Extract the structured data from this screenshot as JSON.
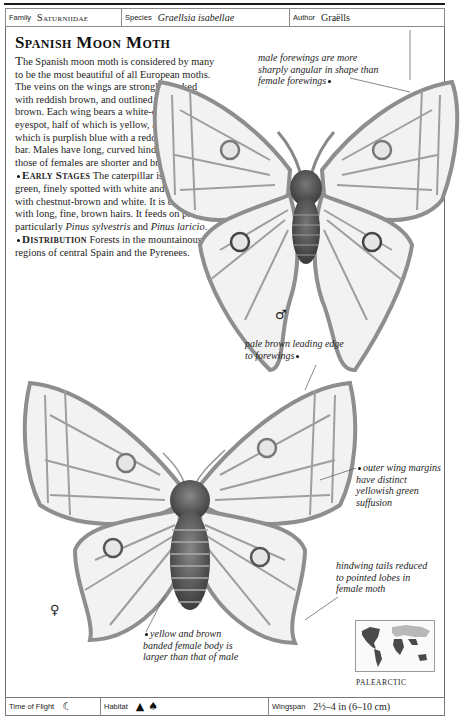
{
  "header": {
    "family_label": "Family",
    "family_value": "Saturniidae",
    "species_label": "Species",
    "species_value": "Graellsia isabellae",
    "author_label": "Author",
    "author_value": "Graëlls"
  },
  "title": "Spanish Moon Moth",
  "body": {
    "intro_first": "T",
    "intro_rest": "he Spanish moon moth is considered by many to be the most beautiful of all European moths. The veins on the wings are strongly marked with reddish brown, and outlined with dark brown. Each wing bears a white-centered eyespot, half of which is yellow, and half of which is purplish blue with a reddish brown bar. Males have long, curved hindwing tails; those of females are shorter and broader.",
    "early_stages_heading": "Early Stages",
    "early_stages_text": " The caterpillar is yellowish green, finely spotted with white and banded with chestnut-brown and white. It is covered with long, fine, brown hairs. It feeds on pines, particularly ",
    "food_plant_1": "Pinus sylvestris",
    "food_plant_join": " and ",
    "food_plant_2": "Pinus laricio",
    "food_plant_end": ".",
    "distribution_heading": "Distribution",
    "distribution_text": " Forests in the mountainous regions of central Spain and the Pyrenees."
  },
  "captions": {
    "male_forewings": "male forewings are more sharply angular in shape than female forewings",
    "leading_edge": "pale brown leading edge to forewings",
    "outer_margins": "outer wing margins have distinct yellowish green suffusion",
    "hindwing_tails": "hindwing tails reduced to pointed lobes in female moth",
    "female_body": "yellow and brown banded female body is larger than that of male"
  },
  "sex_symbols": {
    "male": "♂",
    "female": "♀"
  },
  "map": {
    "region_label": "PALEARCTIC"
  },
  "footer": {
    "time_label": "Time of Flight",
    "time_icon": "crescent-moon-icon",
    "habitat_label": "Habitat",
    "habitat_icons": [
      "mountain-icon",
      "tree-icon"
    ],
    "wingspan_label": "Wingspan",
    "wingspan_value": "2½–4 in (6–10 cm)"
  },
  "colors": {
    "ink": "#1a1a1a",
    "wing_fill": "#f2f2f2",
    "wing_vein": "#8e8e8e",
    "body": "#555555",
    "map_land_dark": "#4a4a4a",
    "map_land_light": "#b8b8b8"
  }
}
